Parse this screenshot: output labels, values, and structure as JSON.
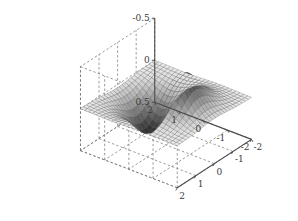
{
  "chart_data": {
    "type": "surface",
    "title": "",
    "xlabel": "",
    "ylabel": "",
    "zlabel": "",
    "grid": true,
    "legend": null,
    "colormap": "gray",
    "projection": "3d-mesh-surface",
    "view": {
      "azimuth": -37.5,
      "elevation": 30
    },
    "xlim": [
      -2,
      2
    ],
    "ylim": [
      -2,
      2
    ],
    "zlim": [
      -0.5,
      0.5
    ],
    "x_ticks": [
      -2,
      -1,
      0,
      1,
      2
    ],
    "y_ticks": [
      -2,
      -1,
      0,
      1,
      2
    ],
    "z_ticks": [
      -0.5,
      0,
      0.5
    ],
    "x_ticklabels": [
      "-2",
      "-1",
      "0",
      "1",
      "2"
    ],
    "y_ticklabels": [
      "2",
      "1",
      "0",
      "-1",
      "-2"
    ],
    "z_ticklabels": [
      "0.5",
      "0",
      "-0.5"
    ],
    "function": "z = x * exp(-x^2 - y^2)",
    "n_grid": 25,
    "z_max": 0.4289,
    "z_min": -0.4289,
    "peak_at": [
      0.707,
      0.0
    ],
    "trough_at": [
      -0.707,
      0.0
    ]
  },
  "axes": {
    "z": {
      "labels": [
        "0.5",
        "0",
        "-0.5"
      ]
    },
    "y_left": {
      "labels": [
        "2",
        "1",
        "0",
        "-1",
        "-2"
      ]
    },
    "x_right": {
      "labels": [
        "-2",
        "-1",
        "0",
        "1",
        "2"
      ]
    }
  },
  "colors": {
    "axis_line": "#4a4a4a",
    "grid_dash": "#6e6e6e",
    "tick_text": "#3a3a3a",
    "background": "#ffffff",
    "surface_dark": "#2b2b2b",
    "surface_mid": "#8a8a8a",
    "surface_light": "#e2e2e2",
    "mesh_line": "#555555"
  }
}
